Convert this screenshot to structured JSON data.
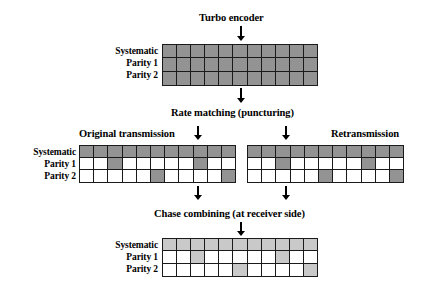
{
  "figure": {
    "title_top": "Turbo encoder",
    "title_mid": "Rate matching (puncturing)",
    "label_original": "Original transmission",
    "label_retransmission": "Retransmission",
    "title_bottom": "Chase combining (at receiver side)",
    "row_labels": [
      "Systematic",
      "Parity 1",
      "Parity 2"
    ],
    "colors": {
      "dark_gray": "#939393",
      "light_gray": "#c9c9c9",
      "white": "#ffffff",
      "line": "#1a1a1a"
    },
    "arrow_icons": [
      "down-arrow-icon-encoder",
      "down-arrow-icon-rate-matching",
      "down-arrow-icon-original",
      "down-arrow-icon-retransmission",
      "down-arrow-icon-original-out",
      "down-arrow-icon-retransmission-out",
      "down-arrow-icon-chase"
    ]
  },
  "chart_data": {
    "type": "diagram-grid",
    "columns": 11,
    "rows": 3,
    "row_names": [
      "Systematic",
      "Parity 1",
      "Parity 2"
    ],
    "legend": {
      "dark_gray": "transmitted bit (original/retransmission)",
      "light_gray": "combined bit (after chase combining)",
      "white": "punctured bit"
    },
    "grids": [
      {
        "name": "encoder-output",
        "caption": "Turbo encoder",
        "fill": "dark",
        "matrix": [
          [
            1,
            1,
            1,
            1,
            1,
            1,
            1,
            1,
            1,
            1,
            1
          ],
          [
            1,
            1,
            1,
            1,
            1,
            1,
            1,
            1,
            1,
            1,
            1
          ],
          [
            1,
            1,
            1,
            1,
            1,
            1,
            1,
            1,
            1,
            1,
            1
          ]
        ]
      },
      {
        "name": "original-transmission",
        "caption": "Original transmission",
        "fill": "dark",
        "matrix": [
          [
            1,
            1,
            1,
            1,
            1,
            1,
            1,
            1,
            1,
            1,
            1
          ],
          [
            0,
            0,
            1,
            0,
            0,
            0,
            0,
            0,
            1,
            0,
            0
          ],
          [
            0,
            0,
            0,
            0,
            0,
            1,
            0,
            0,
            0,
            0,
            1
          ]
        ]
      },
      {
        "name": "retransmission",
        "caption": "Retransmission",
        "fill": "dark",
        "matrix": [
          [
            1,
            1,
            1,
            1,
            1,
            1,
            1,
            1,
            1,
            1,
            1
          ],
          [
            0,
            0,
            1,
            0,
            0,
            0,
            0,
            0,
            1,
            0,
            0
          ],
          [
            0,
            0,
            0,
            0,
            0,
            1,
            0,
            0,
            0,
            0,
            1
          ]
        ]
      },
      {
        "name": "chase-combined",
        "caption": "Chase combining (at receiver side)",
        "fill": "light",
        "matrix": [
          [
            1,
            1,
            1,
            1,
            1,
            1,
            1,
            1,
            1,
            1,
            1
          ],
          [
            0,
            0,
            1,
            0,
            0,
            0,
            0,
            0,
            1,
            0,
            0
          ],
          [
            0,
            0,
            0,
            0,
            0,
            1,
            0,
            0,
            0,
            0,
            1
          ]
        ]
      }
    ]
  }
}
